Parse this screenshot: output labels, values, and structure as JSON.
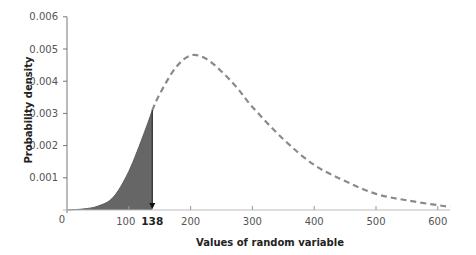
{
  "chart_data": {
    "type": "area",
    "title": "",
    "xlabel": "Values of random variable",
    "ylabel": "Probability density",
    "xlim": [
      0,
      620
    ],
    "ylim": [
      0,
      0.006
    ],
    "x_ticks": [
      0,
      100,
      200,
      300,
      400,
      500,
      600
    ],
    "x_tick_labels": [
      "0",
      "100",
      "200",
      "300",
      "400",
      "500",
      "600"
    ],
    "y_ticks": [
      0.001,
      0.002,
      0.003,
      0.004,
      0.005,
      0.006
    ],
    "y_tick_labels": [
      "0.001",
      "0.002",
      "0.003",
      "0.004",
      "0.005",
      "0.006"
    ],
    "grid": false,
    "legend": null,
    "series": [
      {
        "name": "density curve",
        "style": "dashed",
        "color": "#8a8a8a",
        "x": [
          0,
          25,
          50,
          75,
          100,
          125,
          138,
          150,
          175,
          200,
          225,
          250,
          275,
          300,
          350,
          400,
          450,
          500,
          550,
          600,
          620
        ],
        "values": [
          0.0,
          3e-05,
          0.00012,
          0.0004,
          0.0012,
          0.0024,
          0.0031,
          0.0036,
          0.0044,
          0.0048,
          0.0047,
          0.0043,
          0.0038,
          0.0032,
          0.0022,
          0.0014,
          0.0009,
          0.0005,
          0.0003,
          0.00015,
          0.0001
        ]
      }
    ],
    "shaded_region": {
      "from": 0,
      "to": 138,
      "color": "#666666",
      "description": "Area under curve up to x = 138"
    },
    "annotations": [
      {
        "text": "138",
        "x": 138,
        "style": "bold",
        "marker": "down-arrow at x=138"
      }
    ]
  },
  "labels": {
    "origin": "0",
    "marker_value": "138"
  }
}
